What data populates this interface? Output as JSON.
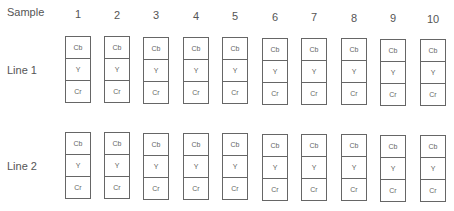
{
  "header": {
    "sample_label": "Sample"
  },
  "columns": [
    "1",
    "2",
    "3",
    "4",
    "5",
    "6",
    "7",
    "8",
    "9",
    "10"
  ],
  "rows": [
    {
      "label": "Line 1",
      "cells": [
        "Cb",
        "Y",
        "Cr"
      ]
    },
    {
      "label": "Line 2",
      "cells": [
        "Cb",
        "Y",
        "Cr"
      ]
    }
  ]
}
